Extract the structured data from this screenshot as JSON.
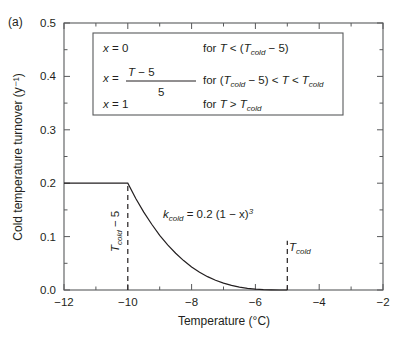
{
  "panel_label": "(a)",
  "chart_data": {
    "type": "line",
    "title": "",
    "xlabel": "Temperature (°C)",
    "ylabel": "Cold temperature turnover (y⁻¹)",
    "xlim": [
      -12,
      -2
    ],
    "ylim": [
      0.0,
      0.5
    ],
    "xticks": [
      -12,
      -10,
      -8,
      -6,
      -4,
      -2
    ],
    "xticklabels": [
      "−12",
      "−10",
      "−8",
      "−6",
      "−4",
      "−2"
    ],
    "yticks": [
      0.0,
      0.1,
      0.2,
      0.3,
      0.4,
      0.5
    ],
    "yticklabels": [
      "0.0",
      "0.1",
      "0.2",
      "0.3",
      "0.4",
      "0.5"
    ],
    "minor_x_step": 1,
    "grid": false,
    "legend": "none",
    "ticks_all_sides": true,
    "series": [
      {
        "name": "k_cold",
        "equation": "k_cold = 0.2 (1 - x)^3",
        "plateau_value": 0.2,
        "breakpoint_x": -10,
        "zero_x": -5,
        "points": [
          [
            -12.0,
            0.2
          ],
          [
            -11.0,
            0.2
          ],
          [
            -10.0,
            0.2
          ],
          [
            -9.75,
            0.1714
          ],
          [
            -9.5,
            0.1458
          ],
          [
            -9.25,
            0.1231
          ],
          [
            -9.0,
            0.1024
          ],
          [
            -8.75,
            0.0844
          ],
          [
            -8.5,
            0.0688
          ],
          [
            -8.25,
            0.0551
          ],
          [
            -8.0,
            0.0432
          ],
          [
            -7.75,
            0.0334
          ],
          [
            -7.5,
            0.025
          ],
          [
            -7.25,
            0.0182
          ],
          [
            -7.0,
            0.0128
          ],
          [
            -6.75,
            0.0086
          ],
          [
            -6.5,
            0.0054
          ],
          [
            -6.25,
            0.0031
          ],
          [
            -6.0,
            0.0016
          ],
          [
            -5.75,
            0.0006
          ],
          [
            -5.5,
            0.0002
          ],
          [
            -5.25,
            0.0
          ],
          [
            -5.0,
            0.0
          ]
        ]
      }
    ],
    "annotations": [
      {
        "name": "curve-equation",
        "x": -7.6,
        "y": 0.125,
        "text": "k_cold = 0.2 (1 - x)^3"
      },
      {
        "name": "tcold-minus-5-label",
        "x": -10,
        "y": 0.1,
        "text": "T_cold - 5",
        "rotated": true
      },
      {
        "name": "tcold-label",
        "x": -5,
        "y": 0.045,
        "text": "T_cold",
        "rotated": false
      }
    ],
    "vlines": [
      {
        "name": "tcold-minus-5-line",
        "x": -10,
        "y_from": 0.0,
        "y_to": 0.2
      },
      {
        "name": "tcold-line",
        "x": -5,
        "y_from": 0.0,
        "y_to": 0.092
      }
    ]
  },
  "equation_box": {
    "rows": [
      {
        "lhs": "x = 0",
        "condition": "for T < (T_cold - 5)"
      },
      {
        "lhs_prefix": "x =",
        "numerator": "T - (T_cold - 5)",
        "denominator": "5",
        "condition": "for (T_cold - 5) < T < T_cold"
      },
      {
        "lhs": "x = 1",
        "condition": "for T > T_cold"
      }
    ]
  },
  "labels": {
    "x_var": "x",
    "eq": "=",
    "zero": "0",
    "one": "1",
    "five": "5",
    "T": "T",
    "cold_sub": "cold",
    "minus_five": "− 5",
    "for": "for",
    "lt": "<",
    "gt": ">",
    "k": "k",
    "k_rhs": "= 0.2 (1 − x)",
    "cube": "3",
    "paren_open": "(",
    "paren_close": ")"
  }
}
